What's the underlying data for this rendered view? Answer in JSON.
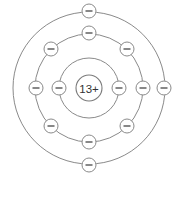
{
  "diagram": {
    "nucleus": {
      "label": "13+",
      "cx": 89,
      "cy": 88,
      "r": 13
    },
    "colors": {
      "stroke": "#8a8a8a",
      "text": "#333333",
      "background": "#ffffff"
    },
    "electron_symbol": "−",
    "electron_radius": 7,
    "shells": [
      {
        "name": "shell-1",
        "r": 30,
        "electron_count": 2,
        "electrons": [
          {
            "x": 59,
            "y": 88
          },
          {
            "x": 119,
            "y": 88
          }
        ]
      },
      {
        "name": "shell-2",
        "r": 54,
        "electron_count": 8,
        "electrons": [
          {
            "x": 89,
            "y": 33
          },
          {
            "x": 127,
            "y": 49
          },
          {
            "x": 143,
            "y": 88
          },
          {
            "x": 127,
            "y": 126
          },
          {
            "x": 89,
            "y": 142
          },
          {
            "x": 51,
            "y": 126
          },
          {
            "x": 36,
            "y": 88
          },
          {
            "x": 51,
            "y": 49
          }
        ]
      },
      {
        "name": "shell-3",
        "r": 76,
        "electron_count": 3,
        "electrons": [
          {
            "x": 89,
            "y": 11
          },
          {
            "x": 164,
            "y": 88
          },
          {
            "x": 89,
            "y": 165
          }
        ]
      }
    ]
  }
}
